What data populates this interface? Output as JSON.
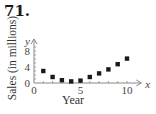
{
  "problem_number": "71.",
  "chart_data": {
    "type": "scatter",
    "title": "",
    "xlabel": "Year",
    "ylabel": "Sales (in millions)",
    "x_axis_var": "x",
    "y_axis_var": "y",
    "x_ticks": [
      0,
      5,
      10
    ],
    "y_ticks": [
      0,
      4,
      8
    ],
    "xlim": [
      0,
      11
    ],
    "ylim": [
      0,
      10
    ],
    "grid": false,
    "legend": null,
    "x": [
      1,
      2,
      3,
      4,
      5,
      6,
      7,
      8,
      9,
      10
    ],
    "y": [
      3.0,
      1.5,
      0.7,
      0.4,
      0.6,
      1.5,
      2.4,
      3.4,
      4.7,
      6.1
    ],
    "marker": "square",
    "color": "#1a1a1a"
  }
}
